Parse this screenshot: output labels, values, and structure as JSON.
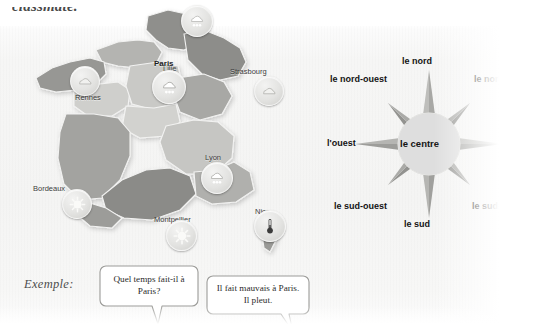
{
  "page": {
    "cut_off_heading": "classmate.",
    "example_label": "Exemple:"
  },
  "map": {
    "name": "map-of-france",
    "cities": [
      {
        "name": "Lille",
        "label": "Lille",
        "weather_icon": "cloud-rain-icon",
        "bold": false
      },
      {
        "name": "Rennes",
        "label": "Rennes",
        "weather_icon": "cloud-icon",
        "bold": false
      },
      {
        "name": "Paris",
        "label": "Paris",
        "weather_icon": "cloud-rain-icon",
        "bold": true
      },
      {
        "name": "Strasbourg",
        "label": "Strasbourg",
        "weather_icon": "cloud-icon",
        "bold": false
      },
      {
        "name": "Lyon",
        "label": "Lyon",
        "weather_icon": "cloud-rain-icon",
        "bold": false
      },
      {
        "name": "Bordeaux",
        "label": "Bordeaux",
        "weather_icon": "sun-icon",
        "bold": false
      },
      {
        "name": "Montpellier",
        "label": "Montpellier",
        "weather_icon": "sun-icon",
        "bold": false
      },
      {
        "name": "Nice",
        "label": "Nice",
        "weather_icon": "thermometer-icon",
        "bold": false
      }
    ]
  },
  "compass": {
    "name": "compass-rose",
    "center": "le centre",
    "directions": {
      "north": "le nord",
      "northeast": "le nord-est",
      "east": "l'est",
      "southeast": "le sud-est",
      "south": "le sud",
      "southwest": "le sud-ouest",
      "west": "l'ouest",
      "northwest": "le nord-ouest"
    }
  },
  "example": {
    "question": "Quel temps fait-il à Paris?",
    "answer": "Il fait mauvais à Paris. Il pleut."
  },
  "colors": {
    "paper": "#f5f5f4",
    "map_light": "#d8d8d6",
    "map_mid": "#c2c2bf",
    "map_dark": "#9f9f9c",
    "map_darkest": "#8a8a87",
    "compass_point_light": "#b9b9b6",
    "compass_point_dark": "#9a9a97",
    "compass_center": "#dcdcda",
    "text": "#2b2b2b"
  }
}
